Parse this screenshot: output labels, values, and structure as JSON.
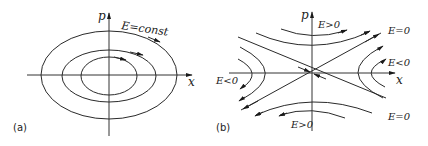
{
  "panels": [
    {
      "id": "a",
      "label": "(a)",
      "axis_x_label": "x",
      "axis_y_label": "p",
      "annotations": [
        "E=const"
      ],
      "description": "Phase portrait: nested closed ellipses (constant energy orbits) with clockwise arrows"
    },
    {
      "id": "b",
      "label": "(b)",
      "axis_x_label": "x",
      "axis_y_label": "p",
      "annotations": [
        "E>0",
        "E=0",
        "E<0",
        "E<0",
        "E=0",
        "E>0"
      ],
      "description": "Phase portrait near saddle point: separatrices E=0, hyperbolic trajectories E>0 (top/bottom) and E<0 (left/right)"
    }
  ],
  "text": {
    "a_label": "(a)",
    "b_label": "(b)",
    "a_p": "p",
    "a_x": "x",
    "a_const": "E=const",
    "b_p": "p",
    "b_x": "x",
    "b_e_gt0_top": "E>0",
    "b_e_eq0_top": "E=0",
    "b_e_lt0_right": "E<0",
    "b_e_lt0_left": "E<0",
    "b_e_eq0_bottom": "E=0",
    "b_e_gt0_bottom": "E>0"
  }
}
